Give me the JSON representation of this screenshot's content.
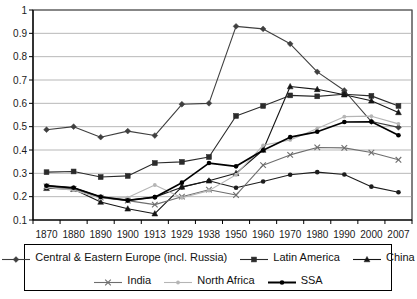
{
  "chart_data": {
    "type": "line",
    "title": "",
    "xlabel": "",
    "ylabel": "",
    "ylim": [
      0.1,
      1.0
    ],
    "ytick_step": 0.1,
    "grid": true,
    "legend_position": "bottom",
    "categories": [
      "1870",
      "1880",
      "1890",
      "1900",
      "1913",
      "1929",
      "1938",
      "1950",
      "1960",
      "1970",
      "1980",
      "1990",
      "2000",
      "2007"
    ],
    "yticks": [
      "1",
      "0.9",
      "0.8",
      "0.7",
      "0.6",
      "0.5",
      "0.4",
      "0.3",
      "0.2",
      "0.1"
    ],
    "series": [
      {
        "name": "Central & Eastern Europe (incl. Russia)",
        "marker": "diamond",
        "color": "#3f3f3f",
        "values": [
          0.487,
          0.5,
          0.455,
          0.481,
          0.462,
          0.596,
          0.6,
          0.93,
          0.919,
          0.855,
          0.735,
          0.655,
          0.522,
          0.497
        ]
      },
      {
        "name": "Latin America",
        "marker": "square",
        "color": "#2b2b2b",
        "values": [
          0.305,
          0.308,
          0.284,
          0.289,
          0.344,
          0.349,
          0.37,
          0.546,
          0.589,
          0.634,
          0.63,
          0.639,
          0.632,
          0.589
        ]
      },
      {
        "name": "China",
        "marker": "triangle",
        "color": "#151515",
        "values": [
          0.236,
          0.232,
          0.177,
          0.148,
          0.127,
          0.242,
          0.268,
          0.3,
          0.4,
          0.672,
          0.66,
          0.637,
          0.611,
          0.561
        ]
      },
      {
        "name": "India",
        "marker": "cross",
        "color": "#6e6e6e",
        "values": [
          0.244,
          0.233,
          0.196,
          0.183,
          0.166,
          0.2,
          0.23,
          0.207,
          0.335,
          0.379,
          0.411,
          0.409,
          0.389,
          0.358
        ]
      },
      {
        "name": "North Africa",
        "marker": "dot",
        "color": "#b5b5b5",
        "values": [
          0.24,
          0.228,
          0.193,
          0.196,
          0.25,
          0.195,
          0.226,
          0.294,
          0.42,
          0.443,
          0.492,
          0.543,
          0.545,
          0.512
        ]
      },
      {
        "name": "SSA",
        "marker": "dot-bold",
        "color": "#000000",
        "values": [
          0.247,
          0.238,
          0.199,
          0.184,
          0.198,
          0.26,
          0.344,
          0.33,
          0.399,
          0.455,
          0.478,
          0.52,
          0.521,
          0.463
        ]
      }
    ],
    "series_low": [
      {
        "name": "SSA-lower",
        "values": [
          0.247,
          0.238,
          0.199,
          0.184,
          0.198,
          0.26,
          0.344,
          0.33,
          0.399,
          0.455,
          0.478,
          0.52,
          0.521,
          0.463
        ]
      }
    ],
    "annotations": []
  },
  "extra_line": {
    "name": "SSA-low-band",
    "values": [
      0.247,
      0.238,
      0.199,
      0.184,
      0.198,
      0.24,
      0.268,
      0.238,
      0.265,
      0.294,
      0.305,
      0.295,
      0.243,
      0.219
    ]
  },
  "legend": {
    "row1": [
      {
        "label": "Central & Eastern Europe (incl. Russia)",
        "marker": "diamond",
        "color": "#3f3f3f"
      },
      {
        "label": "Latin America",
        "marker": "square",
        "color": "#2b2b2b"
      },
      {
        "label": "China",
        "marker": "triangle",
        "color": "#151515"
      }
    ],
    "row2": [
      {
        "label": "India",
        "marker": "cross",
        "color": "#6e6e6e"
      },
      {
        "label": "North Africa",
        "marker": "dot",
        "color": "#b5b5b5"
      },
      {
        "label": "SSA",
        "marker": "dot-bold",
        "color": "#000000"
      }
    ]
  }
}
